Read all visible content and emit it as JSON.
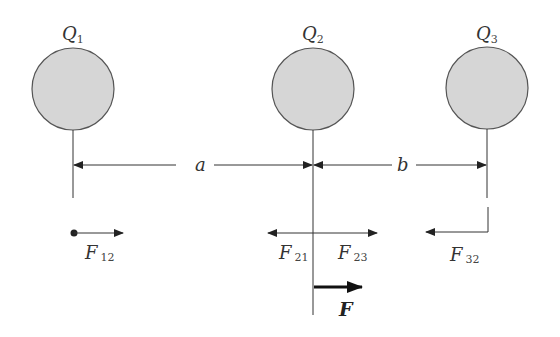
{
  "colors": {
    "sphere_fill": "#d6d6d6",
    "sphere_stroke": "#555555",
    "line": "#333333",
    "text": "#333333"
  },
  "charges": [
    {
      "symbol": "Q",
      "subscript": "1"
    },
    {
      "symbol": "Q",
      "subscript": "2"
    },
    {
      "symbol": "Q",
      "subscript": "3"
    }
  ],
  "distances": {
    "a": "a",
    "b": "b"
  },
  "forces": {
    "f12": {
      "symbol": "F",
      "subscript": "12"
    },
    "f21": {
      "symbol": "F",
      "subscript": "21"
    },
    "f23": {
      "symbol": "F",
      "subscript": "23"
    },
    "f32": {
      "symbol": "F",
      "subscript": "32"
    },
    "net": {
      "symbol": "F"
    }
  }
}
